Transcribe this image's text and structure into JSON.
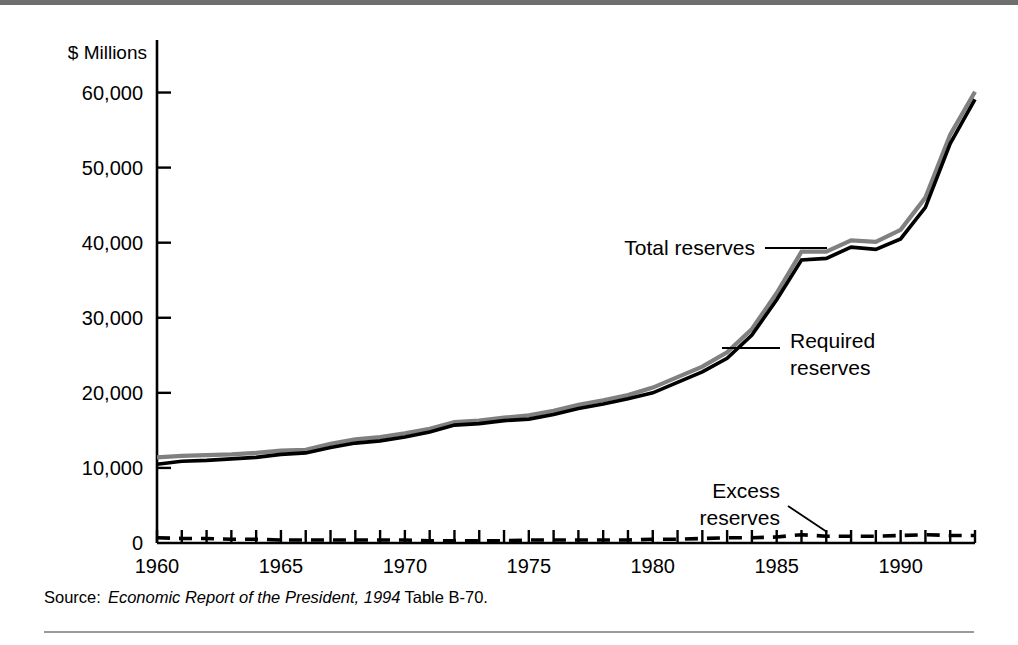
{
  "figure": {
    "source_label": "Source:",
    "source_title": "Economic Report of the President, 1994",
    "source_tail": "Table B-70."
  },
  "chart_data": {
    "type": "line",
    "title": "",
    "xlabel": "",
    "ylabel": "$ Millions",
    "unit_label": "$ Millions",
    "xlim": [
      1960,
      1993
    ],
    "ylim": [
      0,
      63000
    ],
    "grid": false,
    "legend_position": "inline-annotations",
    "x_tick_labels": [
      "1960",
      "1965",
      "1970",
      "1975",
      "1980",
      "1985",
      "1990"
    ],
    "x_tick_values": [
      1960,
      1965,
      1970,
      1975,
      1980,
      1985,
      1990
    ],
    "x_minor_ticks": [
      1960,
      1961,
      1962,
      1963,
      1964,
      1965,
      1966,
      1967,
      1968,
      1969,
      1970,
      1971,
      1972,
      1973,
      1974,
      1975,
      1976,
      1977,
      1978,
      1979,
      1980,
      1981,
      1982,
      1983,
      1984,
      1985,
      1986,
      1987,
      1988,
      1989,
      1990,
      1991,
      1992,
      1993
    ],
    "y_tick_labels": [
      "0",
      "10,000",
      "20,000",
      "30,000",
      "40,000",
      "50,000",
      "60,000"
    ],
    "y_tick_values": [
      0,
      10000,
      20000,
      30000,
      40000,
      50000,
      60000
    ],
    "x": [
      1960,
      1961,
      1962,
      1963,
      1964,
      1965,
      1966,
      1967,
      1968,
      1969,
      1970,
      1971,
      1972,
      1973,
      1974,
      1975,
      1976,
      1977,
      1978,
      1979,
      1980,
      1981,
      1982,
      1983,
      1984,
      1985,
      1986,
      1987,
      1988,
      1989,
      1990,
      1991,
      1992,
      1993
    ],
    "series": [
      {
        "name": "Total reserves",
        "color": "#808080",
        "style": "solid",
        "values": [
          11400,
          11600,
          11700,
          11800,
          12000,
          12300,
          12400,
          13200,
          13800,
          14100,
          14600,
          15200,
          16100,
          16300,
          16700,
          17000,
          17600,
          18400,
          19000,
          19700,
          20700,
          22100,
          23500,
          25400,
          28500,
          33300,
          38800,
          38800,
          40300,
          40100,
          41700,
          46000,
          54400,
          60100
        ]
      },
      {
        "name": "Required reserves",
        "color": "#000000",
        "style": "solid",
        "values": [
          10500,
          10900,
          11000,
          11200,
          11400,
          11800,
          12000,
          12700,
          13300,
          13600,
          14100,
          14800,
          15700,
          15900,
          16300,
          16500,
          17100,
          17900,
          18500,
          19200,
          20000,
          21400,
          22800,
          24600,
          27700,
          32400,
          37700,
          37900,
          39400,
          39100,
          40500,
          44700,
          53200,
          59100
        ]
      },
      {
        "name": "Excess reserves",
        "color": "#000000",
        "style": "dashed",
        "values": [
          700,
          600,
          600,
          500,
          500,
          400,
          400,
          400,
          400,
          400,
          400,
          300,
          300,
          300,
          300,
          400,
          400,
          400,
          400,
          400,
          500,
          500,
          600,
          700,
          700,
          800,
          1100,
          900,
          900,
          900,
          1000,
          1100,
          1000,
          1000
        ]
      }
    ],
    "annotations": [
      {
        "text": "Total reserves",
        "series": "Total reserves",
        "lines": [
          "Total reserves"
        ]
      },
      {
        "text": "Required reserves",
        "series": "Required reserves",
        "lines": [
          "Required",
          "reserves"
        ]
      },
      {
        "text": "Excess reserves",
        "series": "Excess reserves",
        "lines": [
          "Excess",
          "reserves"
        ]
      }
    ]
  }
}
